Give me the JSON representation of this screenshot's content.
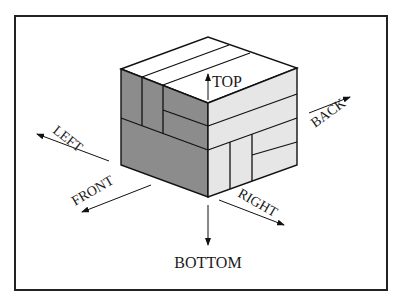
{
  "figure": {
    "type": "isometric cube orientation diagram",
    "colors": {
      "frame": "#222222",
      "left_face": "#8c8c8c",
      "right_face": "#e6e6e6",
      "top_face": "#ffffff",
      "edges": "#111111"
    },
    "labels": {
      "top": "TOP",
      "bottom": "BOTTOM",
      "left": "LEFT",
      "right": "RIGHT",
      "front": "FRONT",
      "back": "BACK"
    }
  }
}
